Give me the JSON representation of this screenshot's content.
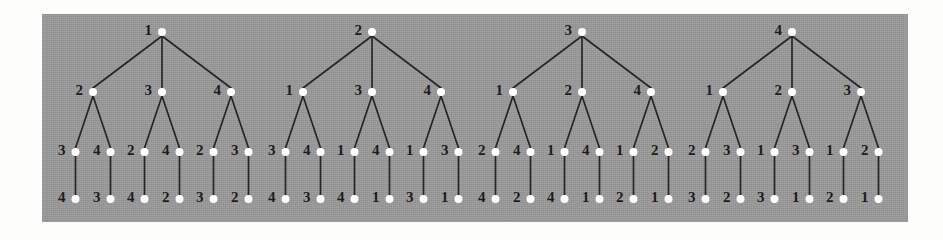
{
  "figure": {
    "background_color": "#fdfdfc",
    "panel_color": "#9a9a9a",
    "node_color": "#ffffff",
    "edge_color": "#262626",
    "label_color": "#1c1c1c",
    "levels": 4,
    "tree_count": 4,
    "leaf_count": 24
  },
  "layout": {
    "panel": {
      "x": 42,
      "y": 14,
      "width": 866,
      "height": 208
    },
    "row_y": [
      32,
      92,
      152,
      199
    ],
    "root_x": [
      162,
      372,
      582,
      792
    ],
    "level2_dx": [
      -69,
      0,
      69
    ],
    "level3_dx": [
      -17.5,
      17.5
    ],
    "node_radius": 4.0,
    "label_offset_x": -6,
    "label_offset_y": 0
  },
  "chart_data": {
    "type": "diagram",
    "trees": [
      {
        "root": "1",
        "branches": [
          {
            "label": "2",
            "children": [
              {
                "label": "3",
                "leaf": "4"
              },
              {
                "label": "4",
                "leaf": "3"
              }
            ]
          },
          {
            "label": "3",
            "children": [
              {
                "label": "2",
                "leaf": "4"
              },
              {
                "label": "4",
                "leaf": "2"
              }
            ]
          },
          {
            "label": "4",
            "children": [
              {
                "label": "2",
                "leaf": "3"
              },
              {
                "label": "3",
                "leaf": "2"
              }
            ]
          }
        ]
      },
      {
        "root": "2",
        "branches": [
          {
            "label": "1",
            "children": [
              {
                "label": "3",
                "leaf": "4"
              },
              {
                "label": "4",
                "leaf": "3"
              }
            ]
          },
          {
            "label": "3",
            "children": [
              {
                "label": "1",
                "leaf": "4"
              },
              {
                "label": "4",
                "leaf": "1"
              }
            ]
          },
          {
            "label": "4",
            "children": [
              {
                "label": "1",
                "leaf": "3"
              },
              {
                "label": "3",
                "leaf": "1"
              }
            ]
          }
        ]
      },
      {
        "root": "3",
        "branches": [
          {
            "label": "1",
            "children": [
              {
                "label": "2",
                "leaf": "4"
              },
              {
                "label": "4",
                "leaf": "2"
              }
            ]
          },
          {
            "label": "2",
            "children": [
              {
                "label": "1",
                "leaf": "4"
              },
              {
                "label": "4",
                "leaf": "1"
              }
            ]
          },
          {
            "label": "4",
            "children": [
              {
                "label": "1",
                "leaf": "2"
              },
              {
                "label": "2",
                "leaf": "1"
              }
            ]
          }
        ]
      },
      {
        "root": "4",
        "branches": [
          {
            "label": "1",
            "children": [
              {
                "label": "2",
                "leaf": "3"
              },
              {
                "label": "3",
                "leaf": "2"
              }
            ]
          },
          {
            "label": "2",
            "children": [
              {
                "label": "1",
                "leaf": "3"
              },
              {
                "label": "3",
                "leaf": "1"
              }
            ]
          },
          {
            "label": "3",
            "children": [
              {
                "label": "1",
                "leaf": "2"
              },
              {
                "label": "2",
                "leaf": "1"
              }
            ]
          }
        ]
      }
    ]
  }
}
